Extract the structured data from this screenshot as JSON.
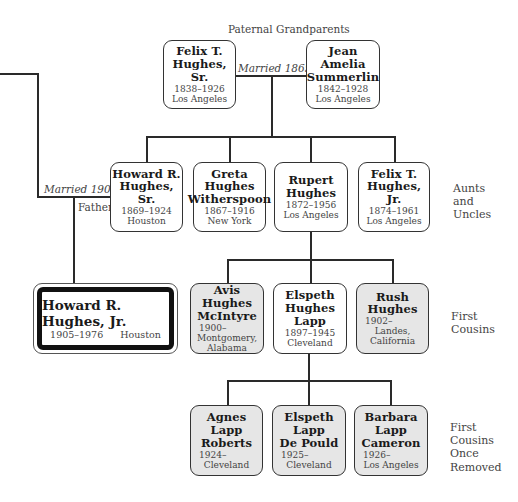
{
  "grandparents": {
    "label": "Paternal Grandparents",
    "marriage": "Married 1865",
    "people": [
      {
        "name1": "Felix T.",
        "name2": "Hughes, Sr.",
        "dates": "1838–1926",
        "place": "Los Angeles"
      },
      {
        "name1": "Jean",
        "name2": "Amelia",
        "name3": "Summerlin",
        "dates": "1842–1928",
        "place": "Los Angeles"
      }
    ]
  },
  "aunts_uncles": {
    "label1": "Aunts",
    "label2": "and",
    "label3": "Uncles",
    "people": [
      {
        "name1": "Howard R.",
        "name2": "Hughes, Sr.",
        "dates": "1869–1924",
        "place": "Houston"
      },
      {
        "name1": "Greta",
        "name2": "Hughes",
        "name3": "Witherspoon",
        "dates": "1867–1916",
        "place": "New York"
      },
      {
        "name1": "Rupert",
        "name2": "Hughes",
        "dates": "1872–1956",
        "place": "Los Angeles"
      },
      {
        "name1": "Felix T.",
        "name2": "Hughes, Jr.",
        "dates": "1874–1961",
        "place": "Los Angeles"
      }
    ]
  },
  "father_link": {
    "marriage": "Married 1904",
    "relation": "Father"
  },
  "subject": {
    "name": "Howard R. Hughes, Jr.",
    "dates": "1905–1976",
    "place": "Houston"
  },
  "first_cousins": {
    "label1": "First",
    "label2": "Cousins",
    "people": [
      {
        "name1": "Avis",
        "name2": "Hughes",
        "name3": "McIntyre",
        "dates": "1900–",
        "place1": "Montgomery,",
        "place2": "Alabama"
      },
      {
        "name1": "Elspeth",
        "name2": "Hughes",
        "name3": "Lapp",
        "dates": "1897–1945",
        "place1": "Cleveland"
      },
      {
        "name1": "Rush",
        "name2": "Hughes",
        "dates": "1902–",
        "place1": "Landes,",
        "place2": "California"
      }
    ]
  },
  "first_cousins_once_removed": {
    "label1": "First",
    "label2": "Cousins",
    "label3": "Once",
    "label4": "Removed",
    "people": [
      {
        "name1": "Agnes",
        "name2": "Lapp",
        "name3": "Roberts",
        "dates": "1924–",
        "place": "Cleveland"
      },
      {
        "name1": "Elspeth",
        "name2": "Lapp",
        "name3": "De Pould",
        "dates": "1925–",
        "place": "Cleveland"
      },
      {
        "name1": "Barbara",
        "name2": "Lapp",
        "name3": "Cameron",
        "dates": "1926–",
        "place": "Los Angeles"
      }
    ]
  },
  "colors": {
    "line": "#2a2a2a",
    "gray_fill": "#e6e6e6",
    "hero_frame": "#111111"
  }
}
